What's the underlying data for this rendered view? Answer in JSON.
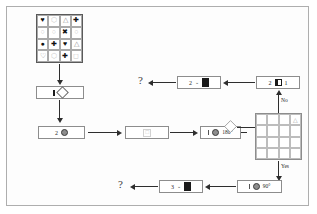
{
  "diagram": {
    "type": "flowchart",
    "frame_color": "#aeaeae",
    "line_color": "#2e2e2e"
  },
  "source_grid": {
    "name": "symbol-grid",
    "rows": 4,
    "cols": 4,
    "cells": [
      {
        "glyph": "♥",
        "tone": "dark"
      },
      {
        "glyph": "⬡",
        "tone": "light"
      },
      {
        "glyph": "△",
        "tone": "mid"
      },
      {
        "glyph": "✚",
        "tone": "dark"
      },
      {
        "glyph": "○",
        "tone": "light"
      },
      {
        "glyph": "○",
        "tone": "light"
      },
      {
        "glyph": "✖",
        "tone": "dark"
      },
      {
        "glyph": "○",
        "tone": "light"
      },
      {
        "glyph": "●",
        "tone": "dark"
      },
      {
        "glyph": "✚",
        "tone": "dark"
      },
      {
        "glyph": "♥",
        "tone": "dark"
      },
      {
        "glyph": "△",
        "tone": "mid"
      },
      {
        "glyph": "♡",
        "tone": "mid"
      },
      {
        "glyph": "⬡",
        "tone": "light"
      },
      {
        "glyph": "✚",
        "tone": "dark"
      },
      {
        "glyph": "◻",
        "tone": "light"
      }
    ]
  },
  "answer_grid": {
    "name": "answer-grid",
    "rows": 4,
    "cols": 4,
    "marked_cell_index": 3,
    "marked_glyph": "△"
  },
  "nodes": {
    "select_shape": {
      "label_number": "",
      "icon_bar": "bar-icon",
      "icon_shape": "diamond-icon"
    },
    "count_two": {
      "label_number": "2",
      "icon": "circle-target-icon"
    },
    "empty_step": {
      "icon": "faint-square-icon"
    },
    "rotate_180": {
      "icon_bar": "bar-icon",
      "icon_circle": "filled-circle-icon",
      "label_angle": "180°"
    },
    "rotate_90": {
      "icon_bar": "bar-icon",
      "icon_circle": "filled-circle-icon",
      "label_angle": "90°"
    },
    "top_right_box": {
      "label_number": "2",
      "icon": "split-block-icon",
      "label_suffix": "1"
    },
    "top_mid_box": {
      "label_number": "2",
      "caret": "⌄",
      "icon": "block-icon"
    },
    "bottom_mid_box": {
      "label_number": "3",
      "caret": "⌄",
      "icon": "block-icon"
    }
  },
  "labels": {
    "question_top": "?",
    "question_bottom": "?",
    "branch_no": "No",
    "branch_yes": "Yes"
  }
}
